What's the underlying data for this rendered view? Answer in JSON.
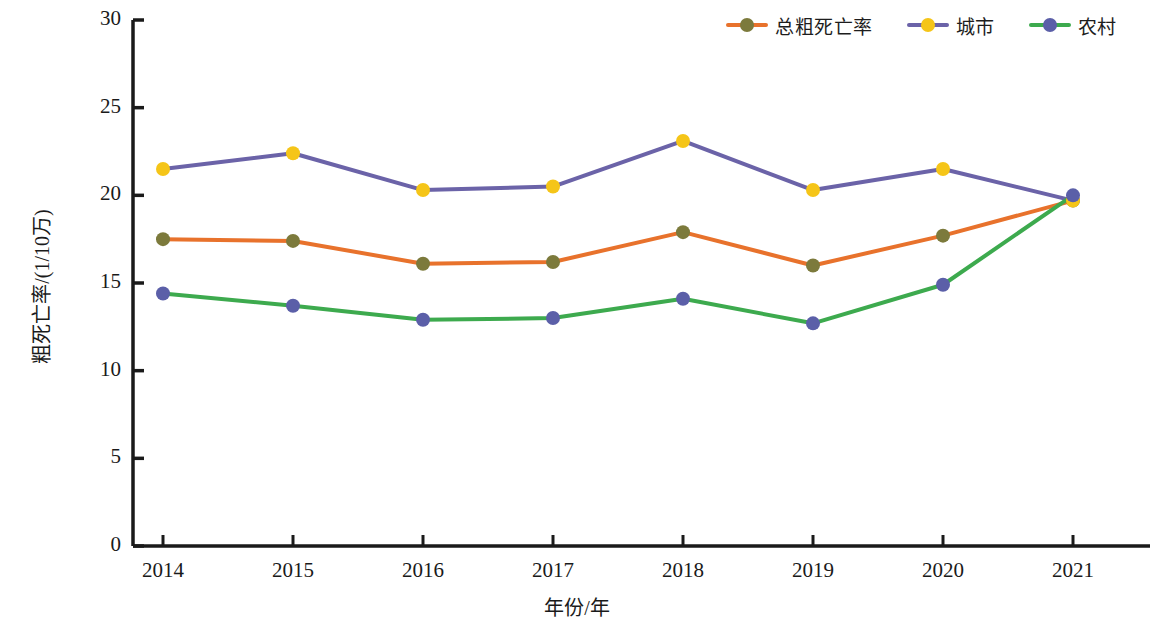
{
  "chart_data": {
    "type": "line",
    "title": "",
    "xlabel": "年份/年",
    "ylabel": "粗死亡率/(1/10万)",
    "x": [
      "2014",
      "2015",
      "2016",
      "2017",
      "2018",
      "2019",
      "2020",
      "2021"
    ],
    "categories": [
      "2014",
      "2015",
      "2016",
      "2017",
      "2018",
      "2019",
      "2020",
      "2021"
    ],
    "xlim": [
      2013.5,
      2021.5
    ],
    "ylim": [
      0,
      30
    ],
    "yticks": [
      "0",
      "5",
      "10",
      "15",
      "20",
      "25",
      "30"
    ],
    "ytick_values": [
      0,
      5,
      10,
      15,
      20,
      25,
      30
    ],
    "xticks": [
      "2014",
      "2015",
      "2016",
      "2017",
      "2018",
      "2019",
      "2020",
      "2021"
    ],
    "grid": false,
    "legend_position": "top-right",
    "series": [
      {
        "name": "总粗死亡率",
        "line_color": "#E8722C",
        "marker_color": "#7C7A3C",
        "values": [
          17.5,
          17.4,
          16.1,
          16.2,
          17.9,
          16.0,
          17.7,
          19.7
        ]
      },
      {
        "name": "城市",
        "line_color": "#6B63A8",
        "marker_color": "#F5C518",
        "values": [
          21.5,
          22.4,
          20.3,
          20.5,
          23.1,
          20.3,
          21.5,
          19.7
        ]
      },
      {
        "name": "农村",
        "line_color": "#3DAA4E",
        "marker_color": "#5B5FA8",
        "values": [
          14.4,
          13.7,
          12.9,
          13.0,
          14.1,
          12.7,
          14.9,
          20.0
        ]
      }
    ]
  },
  "legend": {
    "items": [
      {
        "label": "总粗死亡率",
        "line_color": "#E8722C",
        "marker_color": "#7C7A3C"
      },
      {
        "label": "城市",
        "line_color": "#6B63A8",
        "marker_color": "#F5C518"
      },
      {
        "label": "农村",
        "line_color": "#3DAA4E",
        "marker_color": "#5B5FA8"
      }
    ]
  },
  "axes": {
    "x_title": "年份/年",
    "y_title": "粗死亡率/(1/10万)"
  },
  "colors": {
    "axis": "#1a1a1a",
    "background": "#ffffff"
  }
}
